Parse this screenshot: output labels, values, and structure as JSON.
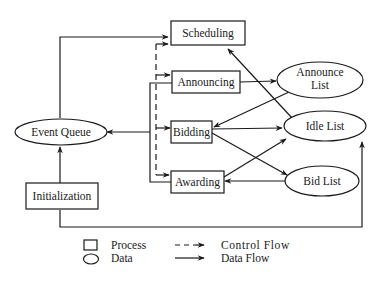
{
  "diagram": {
    "processes": [
      {
        "id": "scheduling",
        "label": "Scheduling"
      },
      {
        "id": "announcing",
        "label": "Announcing"
      },
      {
        "id": "bidding",
        "label": "Bidding"
      },
      {
        "id": "awarding",
        "label": "Awarding"
      },
      {
        "id": "initialization",
        "label": "Initialization"
      }
    ],
    "data_stores": [
      {
        "id": "event_queue",
        "label": "Event Queue"
      },
      {
        "id": "announce_list",
        "label_line1": "Announce",
        "label_line2": "List"
      },
      {
        "id": "idle_list",
        "label": "Idle List"
      },
      {
        "id": "bid_list",
        "label": "Bid List"
      }
    ],
    "data_flows": [
      {
        "from": "event_queue",
        "to": "scheduling"
      },
      {
        "from": "initialization",
        "to": "event_queue"
      },
      {
        "from": "initialization",
        "to": "idle_list"
      },
      {
        "from": "bus",
        "to": "event_queue"
      },
      {
        "from": "announcing",
        "to": "announce_list"
      },
      {
        "from": "announce_list",
        "to": "bidding"
      },
      {
        "from": "bidding",
        "to": "idle_list"
      },
      {
        "from": "bidding",
        "to": "bid_list"
      },
      {
        "from": "idle_list",
        "to": "scheduling"
      },
      {
        "from": "bid_list",
        "to": "awarding"
      },
      {
        "from": "awarding",
        "to": "idle_list"
      }
    ],
    "control_flows": [
      {
        "from": "bus",
        "to": "scheduling"
      },
      {
        "from": "bus",
        "to": "announcing"
      },
      {
        "from": "bus",
        "to": "bidding"
      },
      {
        "from": "bus",
        "to": "awarding"
      }
    ]
  },
  "legend": {
    "process_label": "Process",
    "data_label": "Data",
    "control_flow_label": "Control Flow",
    "data_flow_label": "Data Flow"
  }
}
